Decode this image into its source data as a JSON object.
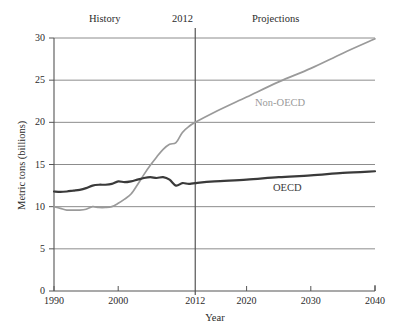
{
  "chart_data": {
    "type": "line",
    "title": "",
    "subtitle": "",
    "xlabel": "Year",
    "ylabel": "Metric tons (billions)",
    "xlim": [
      1990,
      2040
    ],
    "ylim": [
      0,
      30
    ],
    "xticks": [
      "1990",
      "2000",
      "2012",
      "2020",
      "2030",
      "2040"
    ],
    "xtick_values": [
      1990,
      2000,
      2012,
      2020,
      2030,
      2040
    ],
    "yticks": [
      "0",
      "5",
      "10",
      "15",
      "20",
      "25",
      "30"
    ],
    "ytick_values": [
      0,
      5,
      10,
      15,
      20,
      25,
      30
    ],
    "grid": "horizontal",
    "legend_position": "inline-annotation",
    "annotations": [
      {
        "name": "history",
        "text": "History",
        "x": 1996
      },
      {
        "name": "divider-year",
        "text": "2012",
        "x": 2012
      },
      {
        "name": "projections",
        "text": "Projections",
        "x": 2026
      }
    ],
    "divider_line": {
      "x": 2012,
      "label": "2012",
      "color": "#555555"
    },
    "series": [
      {
        "name": "Non-OECD",
        "color": "#9a9a9a",
        "x": [
          1990,
          1991,
          1992,
          1993,
          1994,
          1995,
          1996,
          1997,
          1998,
          1999,
          2000,
          2001,
          2002,
          2003,
          2004,
          2005,
          2006,
          2007,
          2008,
          2009,
          2010,
          2011,
          2012,
          2015,
          2020,
          2025,
          2030,
          2035,
          2040
        ],
        "values": [
          10.0,
          9.8,
          9.6,
          9.6,
          9.6,
          9.7,
          10.0,
          9.9,
          9.9,
          10.0,
          10.4,
          10.9,
          11.5,
          12.6,
          13.8,
          14.9,
          15.9,
          16.8,
          17.4,
          17.6,
          18.8,
          19.5,
          20.0,
          21.2,
          23.0,
          24.8,
          26.4,
          28.2,
          29.9
        ]
      },
      {
        "name": "OECD",
        "color": "#3a3a3a",
        "x": [
          1990,
          1991,
          1992,
          1993,
          1994,
          1995,
          1996,
          1997,
          1998,
          1999,
          2000,
          2001,
          2002,
          2003,
          2004,
          2005,
          2006,
          2007,
          2008,
          2009,
          2010,
          2011,
          2012,
          2015,
          2020,
          2025,
          2030,
          2035,
          2040
        ],
        "values": [
          11.8,
          11.75,
          11.8,
          11.9,
          12.0,
          12.2,
          12.5,
          12.6,
          12.6,
          12.7,
          13.0,
          12.9,
          13.0,
          13.2,
          13.4,
          13.5,
          13.4,
          13.5,
          13.2,
          12.5,
          12.8,
          12.7,
          12.8,
          13.0,
          13.2,
          13.5,
          13.7,
          14.0,
          14.2
        ]
      }
    ]
  },
  "axes": {
    "ylabel": "Metric tons (billions)",
    "xlabel": "Year",
    "yticks": [
      "30",
      "25",
      "20",
      "15",
      "10",
      "5",
      "0"
    ],
    "xticks": [
      "1990",
      "2000",
      "2012",
      "2020",
      "2030",
      "2040"
    ]
  },
  "headers": {
    "history": "History",
    "divider": "2012",
    "projections": "Projections"
  },
  "series_labels": {
    "non_oecd": "Non-OECD",
    "oecd": "OECD"
  },
  "colors": {
    "non_oecd": "#9a9a9a",
    "oecd": "#3a3a3a",
    "grid": "#8c8c8c",
    "axis": "#555555",
    "text": "#2b2b2b"
  }
}
